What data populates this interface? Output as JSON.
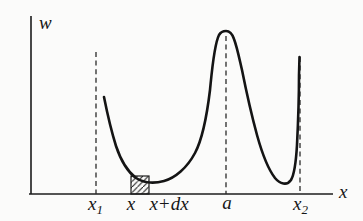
{
  "figure": {
    "name": "probability-density-sketch",
    "background": "#fbfbfa",
    "ink": "#1c1c1c",
    "axes": {
      "y_label": "w",
      "x_label": "x"
    },
    "curve": {
      "path": "M 104,97 C 107,112 111,130 116,146 C 121,161 128,172 136,178 C 144,183 155,183.5 164,181 C 175,178 187,168 195,153 C 203,138 207,115 210,90 C 212,70 214,45 219,35 C 221,31.5 224,31 226,31 C 229,31 232,33 234,39 C 237,47 239,57 242,70 C 246,90 251,113 257,135 C 262,153 268,169 275,178 C 280,184 287,186 291,180 C 294,175 296,162 297,145 C 298,125 299,95 299,75 L 299.5,57"
    },
    "markers": {
      "x1": {
        "x": 96,
        "top": 52,
        "bottom": 194,
        "label_base": "x",
        "label_sub": "1"
      },
      "a": {
        "x": 226,
        "top": 36,
        "bottom": 194,
        "label": "a"
      },
      "x2": {
        "x": 300,
        "top": 57,
        "bottom": 194,
        "label_base": "x",
        "label_sub": "2"
      }
    },
    "interval": {
      "left_label": "x",
      "right_label": "x+dx",
      "rect": {
        "x": 131,
        "y": 176,
        "w": 18,
        "h": 18
      }
    }
  }
}
